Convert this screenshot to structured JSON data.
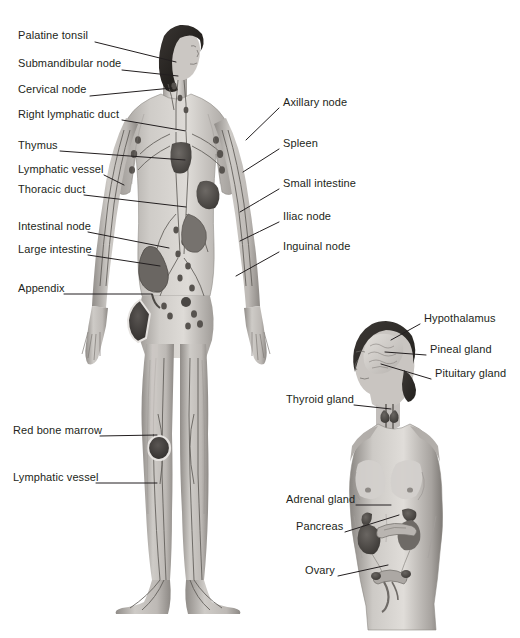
{
  "figures": {
    "lymphatic": {
      "name": "Lymphatic system figure",
      "labels_left": [
        {
          "text": "Palatine tonsil",
          "x": 18,
          "y": 38,
          "tx": 95,
          "ty": 42,
          "px": 176,
          "py": 62
        },
        {
          "text": "Submandibular node",
          "x": 18,
          "y": 66,
          "tx": 122,
          "ty": 70,
          "px": 178,
          "py": 76
        },
        {
          "text": "Cervical node",
          "x": 18,
          "y": 92,
          "tx": 90,
          "ty": 96,
          "px": 172,
          "py": 88
        },
        {
          "text": "Right lymphatic duct",
          "x": 18,
          "y": 117,
          "tx": 122,
          "ty": 120,
          "px": 186,
          "py": 131
        },
        {
          "text": "Thymus",
          "x": 18,
          "y": 148,
          "tx": 60,
          "ty": 151,
          "px": 185,
          "py": 160
        },
        {
          "text": "Lymphatic vessel",
          "x": 18,
          "y": 172,
          "tx": 104,
          "ty": 175,
          "px": 124,
          "py": 185
        },
        {
          "text": "Thoracic duct",
          "x": 18,
          "y": 192,
          "tx": 84,
          "ty": 195,
          "px": 186,
          "py": 207
        },
        {
          "text": "Intestinal node",
          "x": 18,
          "y": 229,
          "tx": 88,
          "ty": 232,
          "px": 169,
          "py": 248
        },
        {
          "text": "Large intestine",
          "x": 18,
          "y": 252,
          "tx": 88,
          "ty": 255,
          "px": 160,
          "py": 266
        },
        {
          "text": "Appendix",
          "x": 18,
          "y": 291,
          "tx": 64,
          "ty": 294,
          "px": 152,
          "py": 294
        },
        {
          "text": "Red bone marrow",
          "x": 13,
          "y": 433,
          "tx": 100,
          "ty": 436,
          "px": 157,
          "py": 435
        },
        {
          "text": "Lymphatic vessel",
          "x": 13,
          "y": 480,
          "tx": 96,
          "ty": 483,
          "px": 157,
          "py": 483
        }
      ],
      "labels_right": [
        {
          "text": "Axillary node",
          "x": 283,
          "y": 105,
          "tx": 279,
          "ty": 108,
          "px": 246,
          "py": 140
        },
        {
          "text": "Spleen",
          "x": 283,
          "y": 146,
          "tx": 279,
          "ty": 149,
          "px": 243,
          "py": 172
        },
        {
          "text": "Small intestine",
          "x": 283,
          "y": 186,
          "tx": 279,
          "ty": 189,
          "px": 240,
          "py": 212
        },
        {
          "text": "Iliac node",
          "x": 283,
          "y": 219,
          "tx": 279,
          "ty": 222,
          "px": 240,
          "py": 241
        },
        {
          "text": "Inguinal node",
          "x": 283,
          "y": 249,
          "tx": 279,
          "ty": 252,
          "px": 236,
          "py": 276
        }
      ]
    },
    "endocrine": {
      "name": "Endocrine system figure",
      "labels_right": [
        {
          "text": "Hypothalamus",
          "x": 424,
          "y": 321,
          "tx": 420,
          "ty": 324,
          "px": 391,
          "py": 340
        },
        {
          "text": "Pineal gland",
          "x": 430,
          "y": 352,
          "tx": 426,
          "ty": 355,
          "px": 385,
          "py": 352
        },
        {
          "text": "Pituitary gland",
          "x": 435,
          "y": 376,
          "tx": 431,
          "ty": 379,
          "px": 381,
          "py": 364
        }
      ],
      "labels_left": [
        {
          "text": "Thyroid gland",
          "x": 286,
          "y": 402,
          "tx": 354,
          "ty": 405,
          "px": 391,
          "py": 409
        },
        {
          "text": "Adrenal gland",
          "x": 286,
          "y": 502,
          "tx": 356,
          "ty": 505,
          "px": 391,
          "py": 505
        },
        {
          "text": "Pancreas",
          "x": 296,
          "y": 529,
          "tx": 345,
          "ty": 532,
          "px": 399,
          "py": 515
        },
        {
          "text": "Ovary",
          "x": 305,
          "y": 573,
          "tx": 338,
          "ty": 576,
          "px": 388,
          "py": 565
        }
      ]
    }
  },
  "palette": {
    "background": "#ffffff",
    "text": "#231f20",
    "leader": "#231f20",
    "skin_light": "#d9d6d2",
    "skin_mid": "#b3afab",
    "skin_dark": "#8a8681",
    "organ_dark": "#4a4744",
    "organ_mid": "#6e6a66",
    "hair": "#2e2b28",
    "vessel": "#5c5955"
  }
}
